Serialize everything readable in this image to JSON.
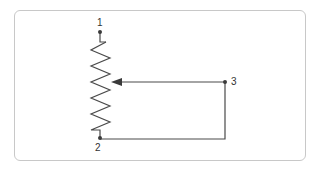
{
  "diagram": {
    "type": "potentiometer-schematic",
    "terminals": [
      {
        "id": "1",
        "label": "1",
        "role": "end-terminal-top"
      },
      {
        "id": "2",
        "label": "2",
        "role": "end-terminal-bottom"
      },
      {
        "id": "3",
        "label": "3",
        "role": "wiper"
      }
    ],
    "connections": [
      {
        "from": "3",
        "to": "wiper-arrow"
      },
      {
        "from": "3",
        "to": "2"
      }
    ],
    "colors": {
      "line": "#4a4a4a",
      "frame": "#c8c8c8"
    }
  }
}
